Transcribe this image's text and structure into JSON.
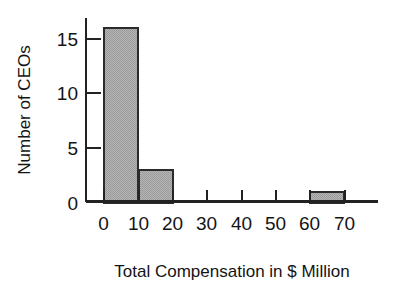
{
  "chart_data": {
    "type": "bar",
    "title": "",
    "subtitle": "",
    "xlabel": "Total Compensation in $ Million",
    "ylabel": "Number of CEOs",
    "grid": false,
    "legend": false,
    "legend_position": "none",
    "bar_style": "histogram",
    "bar_fill_color": "#a9a9a9",
    "bar_edge_color": "#2b2b2b",
    "axis_color": "#222222",
    "background_color": "#ffffff",
    "xlim": [
      -5,
      80
    ],
    "ylim": [
      0,
      16.8
    ],
    "xticks": [
      0,
      10,
      20,
      30,
      40,
      50,
      60,
      70
    ],
    "xtick_labels": [
      "0",
      "10",
      "20",
      "30",
      "40",
      "50",
      "60",
      "70"
    ],
    "yticks": [
      0,
      5,
      10,
      15
    ],
    "ytick_labels": [
      "0",
      "5",
      "10",
      "15"
    ],
    "bin_edges": [
      0,
      10,
      20,
      30,
      40,
      50,
      60,
      70
    ],
    "categories": [
      "0-10",
      "10-20",
      "20-30",
      "30-40",
      "40-50",
      "50-60",
      "60-70"
    ],
    "values": [
      16,
      3,
      0,
      0,
      0,
      0,
      1
    ],
    "bars": [
      {
        "label": "0-10",
        "x0": 0,
        "x1": 10,
        "value": 16
      },
      {
        "label": "10-20",
        "x0": 10,
        "x1": 20,
        "value": 3
      },
      {
        "label": "20-30",
        "x0": 20,
        "x1": 30,
        "value": 0
      },
      {
        "label": "30-40",
        "x0": 30,
        "x1": 40,
        "value": 0
      },
      {
        "label": "40-50",
        "x0": 40,
        "x1": 50,
        "value": 0
      },
      {
        "label": "50-60",
        "x0": 50,
        "x1": 60,
        "value": 0
      },
      {
        "label": "60-70",
        "x0": 60,
        "x1": 70,
        "value": 1
      }
    ],
    "annotations": []
  }
}
